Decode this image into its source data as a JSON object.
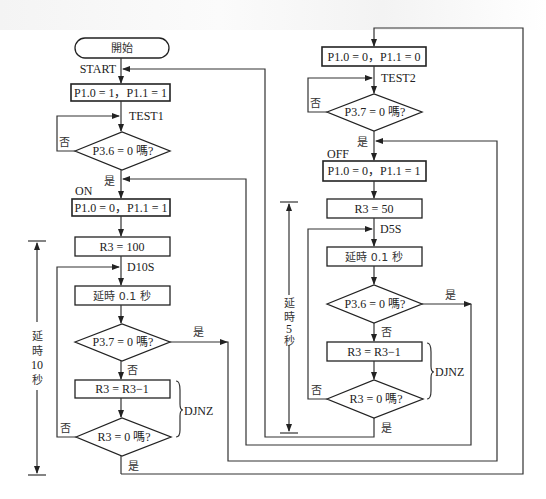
{
  "left": {
    "start": "開始",
    "start_label": "START",
    "init": "P1.0 = 1，P1.1 = 1",
    "test1_label": "TEST1",
    "dec1": "P3.6 = 0 嗎?",
    "no": "否",
    "yes": "是",
    "on_label": "ON",
    "on_box": "P1.0 = 0，P1.1 = 1",
    "r3_init": "R3 = 100",
    "d10s_label": "D10S",
    "delay": "延時 0.1 秒",
    "dec2": "P3.7 = 0 嗎?",
    "dec_r3": "R3 = R3−1",
    "dec3": "R3 = 0 嗎?",
    "djnz": "DJNZ",
    "dim_chars": [
      "延",
      "時",
      "10",
      "秒"
    ]
  },
  "right": {
    "off0_box": "P1.0 = 0，P1.1 = 0",
    "test2_label": "TEST2",
    "dec1": "P3.7 = 0 嗎?",
    "no": "否",
    "yes": "是",
    "off_label": "OFF",
    "off_box": "P1.0 = 0，P1.1 = 1",
    "r3_init": "R3 = 50",
    "d5s_label": "D5S",
    "delay": "延時 0.1 秒",
    "dec2": "P3.6 = 0 嗎?",
    "dec_r3": "R3 = R3−1",
    "dec3": "R3 = 0 嗎?",
    "djnz": "DJNZ",
    "dim_chars": [
      "延",
      "時",
      "5",
      "秒"
    ]
  }
}
